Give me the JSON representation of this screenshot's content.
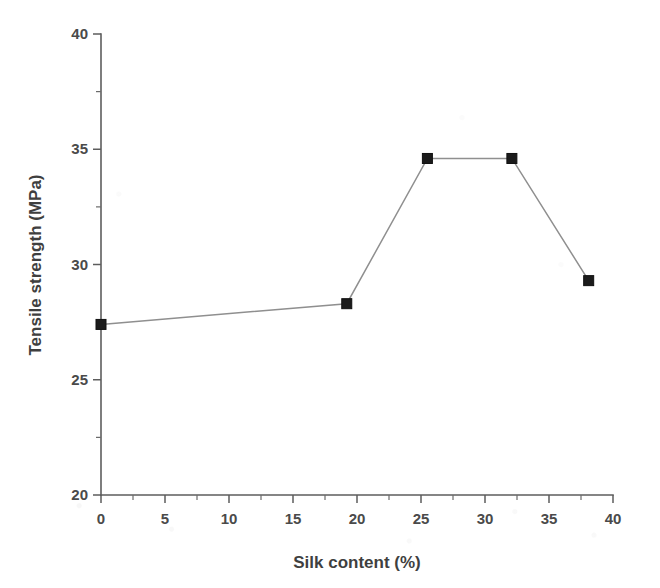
{
  "chart_data": {
    "type": "line",
    "title": "",
    "xlabel": "Silk content (%)",
    "ylabel": "Tensile strength (MPa)",
    "xlim": [
      0,
      40
    ],
    "ylim": [
      20,
      40
    ],
    "xticks": [
      0,
      5,
      10,
      15,
      20,
      25,
      30,
      35,
      40
    ],
    "xtick_labels": [
      "0",
      "5",
      "10",
      "15",
      "20",
      "25",
      "30",
      "35",
      "40"
    ],
    "yticks": [
      20,
      25,
      30,
      35,
      40
    ],
    "ytick_labels": [
      "20",
      "25",
      "30",
      "35",
      "40"
    ],
    "x_minor_tick_step": 2.5,
    "y_minor_tick_step": 2.5,
    "grid": false,
    "legend": false,
    "marker": "filled-square",
    "line_color": "#8f8f8f",
    "marker_color": "#1b1b1b",
    "series": [
      {
        "name": "Tensile strength",
        "x": [
          0,
          19.2,
          25.5,
          32.1,
          38.1
        ],
        "y": [
          27.4,
          28.3,
          34.6,
          34.6,
          29.3
        ],
        "points": [
          {
            "x": 0,
            "y": 27.4
          },
          {
            "x": 19.2,
            "y": 28.3
          },
          {
            "x": 25.5,
            "y": 34.6
          },
          {
            "x": 32.1,
            "y": 34.6
          },
          {
            "x": 38.1,
            "y": 29.3
          }
        ]
      }
    ]
  },
  "figure": {
    "background_color": "#ffffff",
    "axis_color": "#5d5d5d",
    "text_color": "#4a4a4a"
  }
}
